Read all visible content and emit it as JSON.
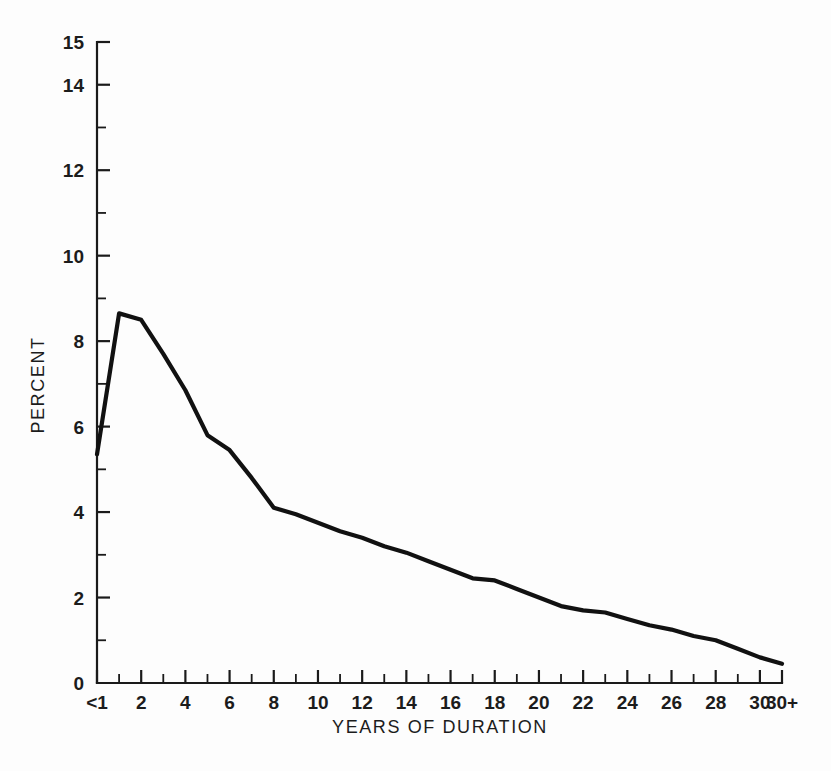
{
  "chart_data": {
    "type": "line",
    "title": "",
    "xlabel": "YEARS OF DURATION",
    "ylabel": "PERCENT",
    "xlim": [
      0,
      31
    ],
    "ylim": [
      0,
      15
    ],
    "grid": false,
    "legend": null,
    "y_tick_labels": [
      "0",
      "2",
      "4",
      "6",
      "8",
      "10",
      "12",
      "14",
      "15"
    ],
    "y_tick_values": [
      0,
      2,
      4,
      6,
      8,
      10,
      12,
      14,
      15
    ],
    "y_minor_tick_values": [
      1,
      3,
      5,
      7,
      9,
      11,
      13
    ],
    "x_tick_labels": [
      "<1",
      "2",
      "4",
      "6",
      "8",
      "10",
      "12",
      "14",
      "16",
      "18",
      "20",
      "22",
      "24",
      "26",
      "28",
      "30",
      "30+"
    ],
    "x_tick_positions": [
      0,
      2,
      4,
      6,
      8,
      10,
      12,
      14,
      16,
      18,
      20,
      22,
      24,
      26,
      28,
      30,
      31
    ],
    "categories": [
      "<1",
      "1",
      "2",
      "3",
      "4",
      "5",
      "6",
      "7",
      "8",
      "9",
      "10",
      "11",
      "12",
      "13",
      "14",
      "15",
      "16",
      "17",
      "18",
      "19",
      "20",
      "21",
      "22",
      "23",
      "24",
      "25",
      "26",
      "27",
      "28",
      "29",
      "30",
      "30+"
    ],
    "x": [
      0,
      1,
      2,
      3,
      4,
      5,
      6,
      7,
      8,
      9,
      10,
      11,
      12,
      13,
      14,
      15,
      16,
      17,
      18,
      19,
      20,
      21,
      22,
      23,
      24,
      25,
      26,
      27,
      28,
      29,
      30,
      31
    ],
    "values": [
      5.35,
      8.65,
      8.5,
      7.7,
      6.85,
      5.8,
      5.45,
      4.8,
      4.1,
      3.95,
      3.75,
      3.55,
      3.4,
      3.2,
      3.05,
      2.85,
      2.65,
      2.45,
      2.4,
      2.2,
      2.0,
      1.8,
      1.7,
      1.65,
      1.5,
      1.35,
      1.25,
      1.1,
      1.0,
      0.8,
      0.6,
      0.45
    ],
    "series": [
      {
        "name": "Percent by years of duration",
        "color": "#111111",
        "values": [
          5.35,
          8.65,
          8.5,
          7.7,
          6.85,
          5.8,
          5.45,
          4.8,
          4.1,
          3.95,
          3.75,
          3.55,
          3.4,
          3.2,
          3.05,
          2.85,
          2.65,
          2.45,
          2.4,
          2.2,
          2.0,
          1.8,
          1.7,
          1.65,
          1.5,
          1.35,
          1.25,
          1.1,
          1.0,
          0.8,
          0.6,
          0.45
        ]
      }
    ]
  },
  "figure": {
    "background_color": "#fdfdfd",
    "line_color": "#111111",
    "axis_color": "#1a1a1a"
  }
}
